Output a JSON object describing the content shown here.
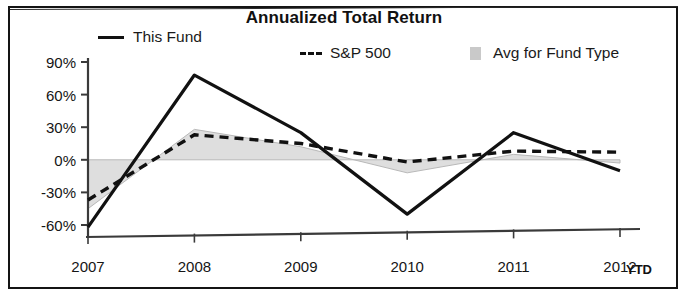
{
  "chart_data": {
    "type": "line",
    "title": "Annualized Total Return",
    "xlabel": "",
    "ylabel": "",
    "categories": [
      "2007",
      "2008",
      "2009",
      "2010",
      "2011",
      "2012"
    ],
    "x_axis_note": "YTD",
    "ylim": [
      -60,
      90
    ],
    "ytick_labels": [
      "90%",
      "60%",
      "30%",
      "0%",
      "-30%",
      "-60%"
    ],
    "ytick_values": [
      90,
      60,
      30,
      0,
      -30,
      -60
    ],
    "grid": false,
    "legend_position": "top",
    "series": [
      {
        "name": "This Fund",
        "style": "solid",
        "color": "#111111",
        "values": [
          -62,
          78,
          25,
          -50,
          25,
          -10
        ]
      },
      {
        "name": "S&P 500",
        "style": "dashed",
        "color": "#111111",
        "values": [
          -37,
          23,
          15,
          -2,
          8,
          7
        ]
      },
      {
        "name": "Avg for Fund Type",
        "style": "shaded-area",
        "color": "#c9c9c9",
        "values": [
          -45,
          28,
          12,
          -12,
          5,
          -3
        ]
      }
    ]
  },
  "legend": {
    "fund_label": "This Fund",
    "sp_label": "S&P 500",
    "avg_label": "Avg for Fund Type"
  },
  "colors": {
    "line": "#111111",
    "band_fill": "#dedede",
    "band_edge": "#b8b8b8",
    "axis": "#3a3a3a",
    "frame": "#141414"
  }
}
